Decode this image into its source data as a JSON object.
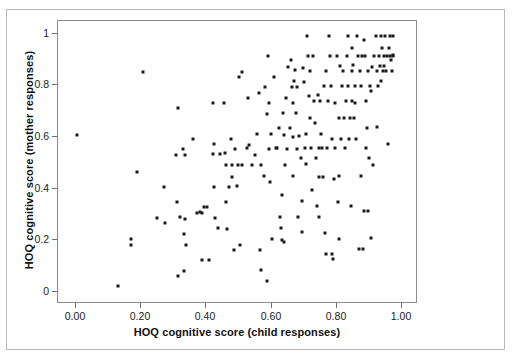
{
  "chart_data": {
    "type": "scatter",
    "title": "",
    "xlabel": "HOQ cognitive score (child responses)",
    "ylabel": "HOQ cognitive score (mother responses)",
    "xlim": [
      -0.04,
      1.07
    ],
    "ylim": [
      -0.06,
      1.06
    ],
    "xticks": [
      0.0,
      0.2,
      0.4,
      0.6,
      0.8,
      1.0
    ],
    "xticklabels": [
      "0.00",
      "0.20",
      "0.40",
      "0.60",
      "0.80",
      "1.00"
    ],
    "yticks": [
      0.0,
      0.2,
      0.4,
      0.6,
      0.8,
      1.0
    ],
    "yticklabels": [
      "0",
      "0.2",
      "0.4",
      "0.6",
      "0.8",
      "1"
    ],
    "grid": false,
    "legend": null,
    "marker": "filled-square",
    "marker_color": "#1a1a1a",
    "marker_size_px": 3,
    "n_points": 214,
    "series": [
      {
        "name": "HOQ cognitive score pairs",
        "points": [
          [
            0.02,
            0.605
          ],
          [
            0.145,
            0.003
          ],
          [
            0.185,
            0.19
          ],
          [
            0.185,
            0.168
          ],
          [
            0.205,
            0.458
          ],
          [
            0.225,
            0.855
          ],
          [
            0.268,
            0.275
          ],
          [
            0.29,
            0.398
          ],
          [
            0.292,
            0.253
          ],
          [
            0.327,
            0.525
          ],
          [
            0.33,
            0.338
          ],
          [
            0.332,
            0.712
          ],
          [
            0.333,
            0.045
          ],
          [
            0.338,
            0.277
          ],
          [
            0.348,
            0.548
          ],
          [
            0.35,
            0.212
          ],
          [
            0.352,
            0.063
          ],
          [
            0.355,
            0.27
          ],
          [
            0.358,
            0.168
          ],
          [
            0.378,
            0.588
          ],
          [
            0.392,
            0.295
          ],
          [
            0.4,
            0.298
          ],
          [
            0.408,
            0.108
          ],
          [
            0.412,
            0.318
          ],
          [
            0.422,
            0.317
          ],
          [
            0.428,
            0.107
          ],
          [
            0.44,
            0.735
          ],
          [
            0.442,
            0.53
          ],
          [
            0.443,
            0.568
          ],
          [
            0.445,
            0.398
          ],
          [
            0.448,
            0.275
          ],
          [
            0.455,
            0.234
          ],
          [
            0.475,
            0.735
          ],
          [
            0.478,
            0.532
          ],
          [
            0.48,
            0.338
          ],
          [
            0.482,
            0.488
          ],
          [
            0.485,
            0.232
          ],
          [
            0.49,
            0.398
          ],
          [
            0.497,
            0.59
          ],
          [
            0.5,
            0.44
          ],
          [
            0.5,
            0.485
          ],
          [
            0.505,
            0.148
          ],
          [
            0.51,
            0.55
          ],
          [
            0.515,
            0.403
          ],
          [
            0.518,
            0.485
          ],
          [
            0.52,
            0.838
          ],
          [
            0.525,
            0.168
          ],
          [
            0.532,
            0.857
          ],
          [
            0.545,
            0.555
          ],
          [
            0.548,
            0.752
          ],
          [
            0.552,
            0.565
          ],
          [
            0.562,
            0.487
          ],
          [
            0.57,
            0.527
          ],
          [
            0.578,
            0.608
          ],
          [
            0.582,
            0.775
          ],
          [
            0.585,
            0.148
          ],
          [
            0.59,
            0.068
          ],
          [
            0.598,
            0.442
          ],
          [
            0.602,
            0.795
          ],
          [
            0.608,
            0.025
          ],
          [
            0.612,
            0.92
          ],
          [
            0.613,
            0.735
          ],
          [
            0.615,
            0.548
          ],
          [
            0.618,
            0.42
          ],
          [
            0.62,
            0.608
          ],
          [
            0.625,
            0.193
          ],
          [
            0.63,
            0.838
          ],
          [
            0.635,
            0.555
          ],
          [
            0.64,
            0.552
          ],
          [
            0.645,
            0.632
          ],
          [
            0.648,
            0.278
          ],
          [
            0.65,
            0.235
          ],
          [
            0.655,
            0.188
          ],
          [
            0.658,
            0.693
          ],
          [
            0.66,
            0.605
          ],
          [
            0.662,
            0.178
          ],
          [
            0.665,
            0.487
          ],
          [
            0.668,
            0.755
          ],
          [
            0.67,
            0.55
          ],
          [
            0.672,
            0.878
          ],
          [
            0.678,
            0.632
          ],
          [
            0.682,
            0.905
          ],
          [
            0.685,
            0.795
          ],
          [
            0.688,
            0.443
          ],
          [
            0.69,
            0.598
          ],
          [
            0.695,
            0.863
          ],
          [
            0.698,
            0.692
          ],
          [
            0.7,
            0.797
          ],
          [
            0.702,
            0.548
          ],
          [
            0.705,
            0.278
          ],
          [
            0.708,
            0.603
          ],
          [
            0.712,
            0.512
          ],
          [
            0.715,
            0.218
          ],
          [
            0.718,
            0.342
          ],
          [
            0.72,
            0.873
          ],
          [
            0.722,
            0.818
          ],
          [
            0.725,
            0.555
          ],
          [
            0.728,
            0.492
          ],
          [
            0.73,
            0.61
          ],
          [
            0.733,
            1.0
          ],
          [
            0.735,
            0.92
          ],
          [
            0.738,
            0.763
          ],
          [
            0.742,
            0.86
          ],
          [
            0.745,
            0.552
          ],
          [
            0.748,
            0.385
          ],
          [
            0.752,
            0.921
          ],
          [
            0.755,
            0.742
          ],
          [
            0.758,
            0.655
          ],
          [
            0.76,
            0.515
          ],
          [
            0.762,
            0.322
          ],
          [
            0.765,
            0.765
          ],
          [
            0.768,
            0.553
          ],
          [
            0.77,
            0.277
          ],
          [
            0.772,
            0.742
          ],
          [
            0.775,
            0.608
          ],
          [
            0.778,
            0.552
          ],
          [
            0.782,
            0.44
          ],
          [
            0.785,
            0.802
          ],
          [
            0.788,
            0.215
          ],
          [
            0.79,
            0.132
          ],
          [
            0.792,
            0.862
          ],
          [
            0.795,
            0.555
          ],
          [
            0.797,
            0.74
          ],
          [
            0.8,
            1.0
          ],
          [
            0.802,
            0.92
          ],
          [
            0.805,
            0.802
          ],
          [
            0.808,
            0.133
          ],
          [
            0.81,
            0.59
          ],
          [
            0.812,
            0.112
          ],
          [
            0.815,
            0.432
          ],
          [
            0.818,
            0.735
          ],
          [
            0.82,
            0.555
          ],
          [
            0.825,
            0.92
          ],
          [
            0.828,
            0.338
          ],
          [
            0.83,
            0.443
          ],
          [
            0.832,
            0.193
          ],
          [
            0.835,
            0.882
          ],
          [
            0.838,
            0.59
          ],
          [
            0.84,
            0.802
          ],
          [
            0.845,
            0.862
          ],
          [
            0.848,
            0.672
          ],
          [
            0.85,
            0.555
          ],
          [
            0.852,
            0.742
          ],
          [
            0.855,
            0.92
          ],
          [
            0.858,
            1.0
          ],
          [
            0.86,
            0.802
          ],
          [
            0.863,
            0.59
          ],
          [
            0.865,
            0.672
          ],
          [
            0.868,
            0.322
          ],
          [
            0.87,
            0.86
          ],
          [
            0.872,
            0.952
          ],
          [
            0.875,
            0.883
          ],
          [
            0.878,
            0.672
          ],
          [
            0.88,
            0.802
          ],
          [
            0.882,
            0.735
          ],
          [
            0.885,
            0.59
          ],
          [
            0.888,
            1.0
          ],
          [
            0.89,
            0.92
          ],
          [
            0.892,
            0.152
          ],
          [
            0.895,
            0.862
          ],
          [
            0.898,
            0.802
          ],
          [
            0.9,
            0.443
          ],
          [
            0.902,
            0.922
          ],
          [
            0.905,
            0.152
          ],
          [
            0.908,
            0.302
          ],
          [
            0.91,
            0.985
          ],
          [
            0.912,
            0.92
          ],
          [
            0.915,
            0.553
          ],
          [
            0.918,
            0.632
          ],
          [
            0.92,
            0.302
          ],
          [
            0.922,
            0.862
          ],
          [
            0.925,
            0.512
          ],
          [
            0.928,
            0.802
          ],
          [
            0.93,
            0.783
          ],
          [
            0.932,
            0.195
          ],
          [
            0.935,
            0.878
          ],
          [
            0.938,
            0.488
          ],
          [
            0.94,
            0.92
          ],
          [
            0.945,
            1.0
          ],
          [
            0.95,
            0.862
          ],
          [
            0.952,
            0.802
          ],
          [
            0.955,
            0.92
          ],
          [
            0.958,
            0.882
          ],
          [
            0.96,
            0.822
          ],
          [
            0.962,
            1.0
          ],
          [
            0.965,
            0.952
          ],
          [
            0.968,
            0.862
          ],
          [
            0.97,
            0.92
          ],
          [
            0.972,
            0.882
          ],
          [
            0.975,
            1.0
          ],
          [
            0.978,
            0.862
          ],
          [
            0.98,
            0.921
          ],
          [
            0.982,
            0.568
          ],
          [
            0.985,
            0.952
          ],
          [
            0.988,
            0.92
          ],
          [
            0.99,
            1.0
          ],
          [
            0.992,
            0.905
          ],
          [
            0.995,
            0.862
          ],
          [
            0.998,
            0.925
          ],
          [
            1.0,
            1.0
          ],
          [
            1.0,
            0.92
          ],
          [
            0.655,
            0.365
          ],
          [
            0.59,
            0.488
          ],
          [
            0.53,
            0.487
          ],
          [
            0.462,
            0.53
          ],
          [
            0.408,
            0.295
          ],
          [
            0.355,
            0.527
          ],
          [
            0.742,
            0.672
          ],
          [
            0.688,
            0.735
          ],
          [
            0.77,
            0.44
          ],
          [
            0.832,
            0.672
          ],
          [
            0.87,
            0.742
          ],
          [
            0.915,
            0.742
          ],
          [
            0.948,
            0.637
          ],
          [
            0.692,
            0.822
          ],
          [
            0.608,
            0.688
          ]
        ]
      }
    ]
  },
  "axes": {
    "x_title": "HOQ cognitive score (child responses)",
    "y_title": "HOQ cognitive score (mother responses)",
    "x_tick_labels": [
      "0.00",
      "0.20",
      "0.40",
      "0.60",
      "0.80",
      "1.00"
    ],
    "y_tick_labels": [
      "1",
      "0.8",
      "0.6",
      "0.4",
      "0.2",
      "0"
    ]
  },
  "style": {
    "marker_color": "#1a1a1a",
    "axis_color": "#8c8c8c",
    "frame_color": "#b9b9b9",
    "background": "#ffffff"
  }
}
